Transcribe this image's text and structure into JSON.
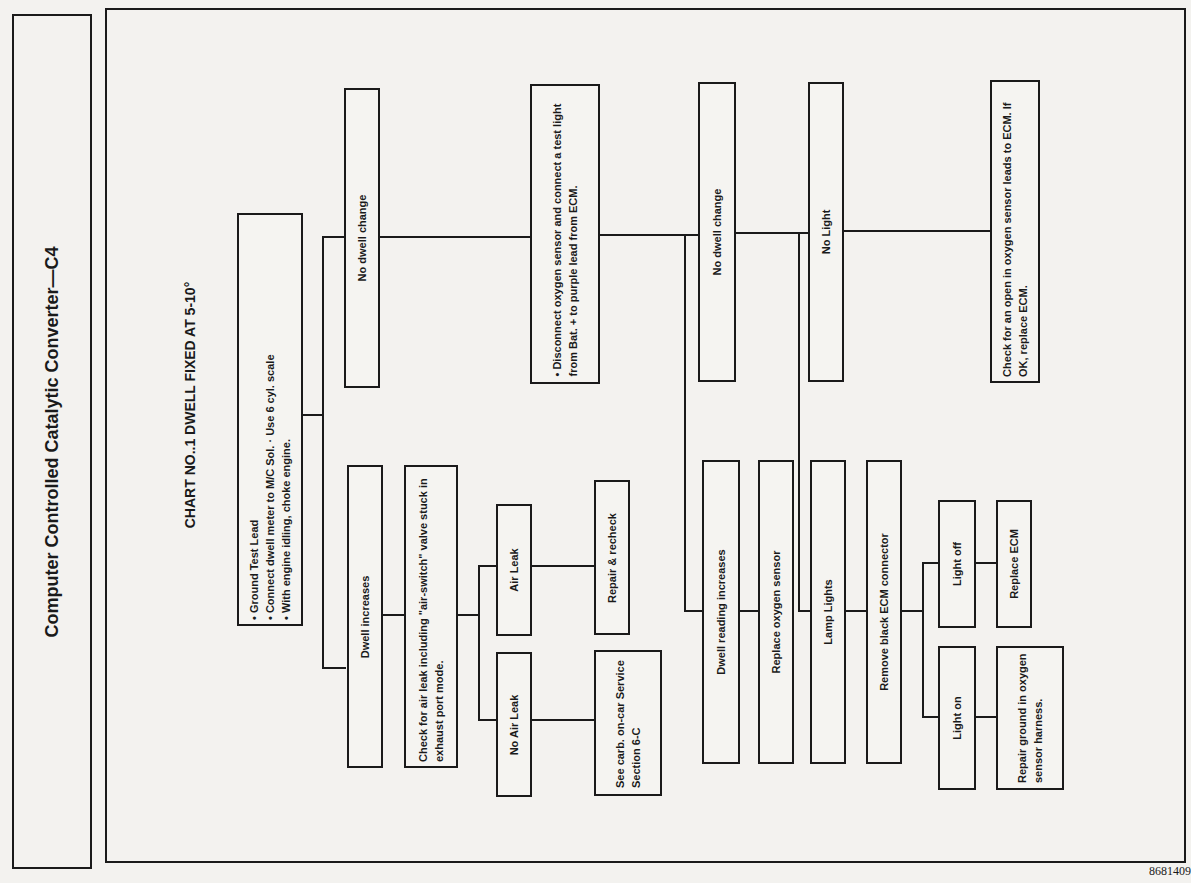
{
  "side_title": "Computer Controlled Catalytic Converter—C4",
  "chart_title": "CHART NO..1   DWELL FIXED AT 5-10°",
  "figure_number": "8681409",
  "nodes": {
    "start": [
      "Ground Test Lead",
      "Connect dwell meter to M/C Sol. · Use 6 cyl. scale",
      "With engine idling, choke engine."
    ],
    "no_dwell_change_1": "No dwell change",
    "dwell_increases": "Dwell increases",
    "check_air_leak": "Check for air leak including \"air-switch\" valve stuck in exhaust port mode.",
    "air_leak": "Air Leak",
    "no_air_leak": "No Air Leak",
    "repair_recheck": "Repair & recheck",
    "see_carb": "See carb. on-car Service Section 6-C",
    "disconnect_o2": "• Disconnect oxygen sensor and connect a test light from Bat. + to purple lead from ECM.",
    "no_dwell_change_2": "No dwell change",
    "dwell_reading_increases": "Dwell reading increases",
    "replace_o2": "Replace oxygen sensor",
    "no_light": "No Light",
    "lamp_lights": "Lamp Lights",
    "check_open": "Check for an open in oxygen sensor leads to ECM. If OK, replace ECM.",
    "remove_connector": "Remove black ECM connector",
    "light_off": "Light off",
    "light_on": "Light on",
    "replace_ecm": "Replace ECM",
    "repair_ground": "Repair ground in oxygen sensor harness."
  }
}
